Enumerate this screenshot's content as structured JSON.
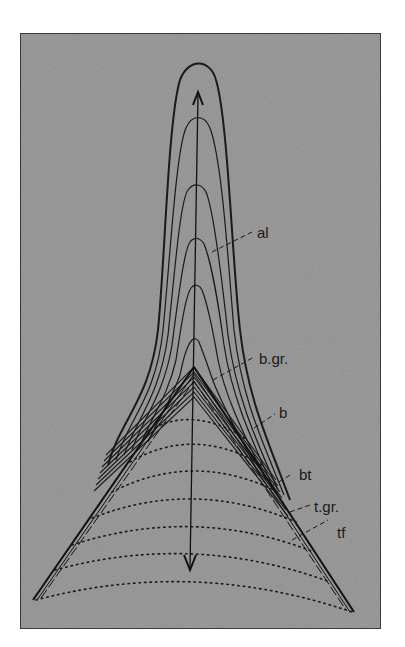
{
  "diagram": {
    "type": "fold-evolution-schematic",
    "background_color": "#8e8e8e",
    "line_color": "#1a1a1a",
    "labels": {
      "al": "al",
      "b_gr": "b.gr.",
      "b": "b",
      "bt": "bt",
      "t_gr": "t.gr.",
      "tf": "tf"
    },
    "arrows": {
      "up": "arrow-up",
      "down": "arrow-down"
    }
  }
}
